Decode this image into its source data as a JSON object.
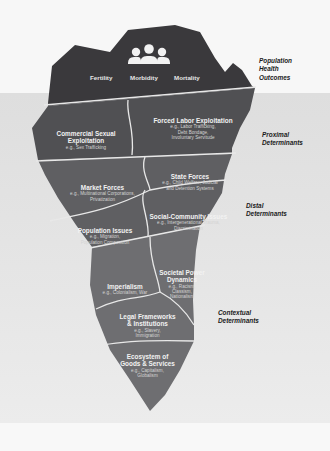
{
  "top": {
    "icon": "people-group-icon",
    "outcomes": [
      "Fertility",
      "Morbidity",
      "Mortality"
    ]
  },
  "side_labels": {
    "population_health_outcomes": [
      "Population",
      "Health",
      "Outcomes"
    ],
    "proximal": [
      "Proximal",
      "Determinants"
    ],
    "distal": [
      "Distal",
      "Determinants"
    ],
    "contextual": [
      "Contextual",
      "Determinants"
    ]
  },
  "segments": {
    "commercial_sexual": {
      "title": "Commercial Sexual Exploitation",
      "examples": "e.g., Sex Trafficking"
    },
    "forced_labor": {
      "title": "Forced Labor Exploitation",
      "examples": [
        "e.g., Labor Trafficking,",
        "Debt Bondage,",
        "Involuntary Servitude"
      ]
    },
    "market_forces": {
      "title": "Market Forces",
      "examples": [
        "e.g., Multinational Corporations,",
        "Privatization"
      ]
    },
    "state_forces": {
      "title": "State Forces",
      "examples": [
        "e.g., Child Welfare, Judicial",
        "and Detention Systems"
      ]
    },
    "population_issues": {
      "title": "Population Issues",
      "examples": [
        "e.g., Migration,",
        "Population Composition"
      ]
    },
    "social_community": {
      "title": "Social-Community Issues",
      "examples": [
        "e.g., Intergenerational Trauma,",
        "Discrimination"
      ]
    },
    "imperialism": {
      "title": "Imperialism",
      "examples": "e.g., Colonialism, War"
    },
    "societal_power": {
      "title": [
        "Societal Power",
        "Dynamics"
      ],
      "examples": [
        "e.g., Racism,",
        "Classism,",
        "Nationalism"
      ]
    },
    "legal_frameworks": {
      "title": [
        "Legal Frameworks",
        "& Institutions"
      ],
      "examples": [
        "e.g., Slavery,",
        "Immigration"
      ]
    },
    "ecosystem": {
      "title": [
        "Ecosystem of",
        "Goods & Services"
      ],
      "examples": [
        "e.g., Capitalism,",
        "Globalism"
      ]
    }
  },
  "colors": {
    "tip": "#3a393c",
    "proximal": "#505053",
    "distal": "#5f5f62",
    "contextual": "#6e6e71",
    "divider": "#e8e8e8"
  }
}
